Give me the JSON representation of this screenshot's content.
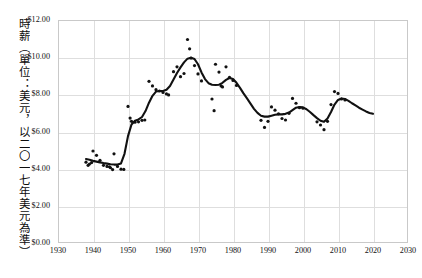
{
  "chart": {
    "type": "scatter",
    "ylabel_vertical": "時薪（單位：美元，以二〇一七年美元為準）",
    "title": "",
    "subtitle": ""
  },
  "axes": {
    "y_ticks": [
      "$0.00",
      "$2.00",
      "$4.00",
      "$6.00",
      "$8.00",
      "$10.00",
      "$12.00"
    ],
    "x_ticks": [
      "1930",
      "1940",
      "1950",
      "1960",
      "1970",
      "1980",
      "1990",
      "2000",
      "2010",
      "2020",
      "2030"
    ]
  },
  "chart_data": {
    "type": "scatter",
    "title": "",
    "xlabel": "",
    "ylabel": "時薪（單位：美元，以二〇一七年美元為準）",
    "xlim": [
      1930,
      2030
    ],
    "ylim": [
      0,
      12
    ],
    "xtick_values": [
      1930,
      1940,
      1950,
      1960,
      1970,
      1980,
      1990,
      2000,
      2010,
      2020,
      2030
    ],
    "ytick_values": [
      0,
      2,
      4,
      6,
      8,
      10,
      12
    ],
    "ytick_labels": [
      "$0.00",
      "$2.00",
      "$4.00",
      "$6.00",
      "$8.00",
      "$10.00",
      "$12.00"
    ],
    "xtick_labels": [
      "1930",
      "1940",
      "1950",
      "1960",
      "1970",
      "1980",
      "1990",
      "2000",
      "2010",
      "2020",
      "2030"
    ],
    "grid": true,
    "legend": "none",
    "series": [
      {
        "name": "scatter-points",
        "marker": "dot",
        "color": "#111111",
        "points": [
          [
            1938,
            4.35
          ],
          [
            1938.6,
            4.18
          ],
          [
            1939,
            4.25
          ],
          [
            1939.6,
            4.33
          ],
          [
            1940,
            4.95
          ],
          [
            1941,
            4.72
          ],
          [
            1942,
            4.45
          ],
          [
            1943,
            4.18
          ],
          [
            1944,
            4.12
          ],
          [
            1944.7,
            4.1
          ],
          [
            1945,
            4.05
          ],
          [
            1945.6,
            3.95
          ],
          [
            1946,
            4.8
          ],
          [
            1947,
            4.12
          ],
          [
            1948,
            3.97
          ],
          [
            1948.8,
            3.96
          ],
          [
            1950,
            7.35
          ],
          [
            1950.6,
            6.72
          ],
          [
            1951,
            6.55
          ],
          [
            1952,
            6.5
          ],
          [
            1953,
            6.52
          ],
          [
            1954,
            6.6
          ],
          [
            1954.8,
            6.62
          ],
          [
            1956,
            8.7
          ],
          [
            1957,
            8.45
          ],
          [
            1958,
            8.25
          ],
          [
            1959,
            8.18
          ],
          [
            1960,
            8.1
          ],
          [
            1961,
            8.02
          ],
          [
            1961.6,
            7.97
          ],
          [
            1963,
            9.22
          ],
          [
            1964,
            9.48
          ],
          [
            1965,
            8.95
          ],
          [
            1966,
            9.12
          ],
          [
            1967,
            10.95
          ],
          [
            1967.6,
            10.45
          ],
          [
            1968,
            9.95
          ],
          [
            1969,
            9.55
          ],
          [
            1970,
            9.1
          ],
          [
            1971,
            8.72
          ],
          [
            1974,
            7.75
          ],
          [
            1974.6,
            7.12
          ],
          [
            1975,
            9.62
          ],
          [
            1976,
            9.2
          ],
          [
            1976.6,
            8.45
          ],
          [
            1977,
            8.4
          ],
          [
            1978,
            9.48
          ],
          [
            1979,
            8.92
          ],
          [
            1980,
            8.75
          ],
          [
            1981,
            8.48
          ],
          [
            1988,
            6.6
          ],
          [
            1989,
            6.22
          ],
          [
            1990,
            6.55
          ],
          [
            1991,
            7.32
          ],
          [
            1992,
            7.15
          ],
          [
            1993,
            6.95
          ],
          [
            1994,
            6.7
          ],
          [
            1995,
            6.62
          ],
          [
            1996,
            6.98
          ],
          [
            1997,
            7.78
          ],
          [
            1998,
            7.52
          ],
          [
            1999,
            7.28
          ],
          [
            2000,
            7.25
          ],
          [
            2004,
            6.52
          ],
          [
            2005,
            6.35
          ],
          [
            2006,
            6.1
          ],
          [
            2007,
            6.55
          ],
          [
            2008,
            7.45
          ],
          [
            2009,
            8.15
          ],
          [
            2010,
            8.05
          ],
          [
            2011,
            7.75
          ],
          [
            2012,
            7.7
          ]
        ]
      },
      {
        "name": "smoothed-trend-line",
        "type": "line",
        "color": "#111111",
        "points": [
          [
            1938,
            4.52
          ],
          [
            1939,
            4.48
          ],
          [
            1940,
            4.42
          ],
          [
            1941,
            4.38
          ],
          [
            1942,
            4.34
          ],
          [
            1943,
            4.3
          ],
          [
            1944,
            4.27
          ],
          [
            1945,
            4.24
          ],
          [
            1946,
            4.22
          ],
          [
            1947,
            4.22
          ],
          [
            1948,
            4.28
          ],
          [
            1949,
            4.8
          ],
          [
            1950,
            5.75
          ],
          [
            1951,
            6.38
          ],
          [
            1952,
            6.58
          ],
          [
            1953,
            6.65
          ],
          [
            1954,
            6.78
          ],
          [
            1955,
            7.1
          ],
          [
            1956,
            7.55
          ],
          [
            1957,
            7.92
          ],
          [
            1958,
            8.15
          ],
          [
            1959,
            8.18
          ],
          [
            1960,
            8.18
          ],
          [
            1961,
            8.25
          ],
          [
            1962,
            8.45
          ],
          [
            1963,
            8.8
          ],
          [
            1964,
            9.15
          ],
          [
            1965,
            9.45
          ],
          [
            1966,
            9.72
          ],
          [
            1967,
            9.92
          ],
          [
            1968,
            9.97
          ],
          [
            1969,
            9.9
          ],
          [
            1970,
            9.62
          ],
          [
            1971,
            9.18
          ],
          [
            1972,
            8.82
          ],
          [
            1973,
            8.6
          ],
          [
            1974,
            8.52
          ],
          [
            1975,
            8.5
          ],
          [
            1976,
            8.52
          ],
          [
            1977,
            8.62
          ],
          [
            1978,
            8.78
          ],
          [
            1979,
            8.88
          ],
          [
            1980,
            8.82
          ],
          [
            1981,
            8.62
          ],
          [
            1982,
            8.35
          ],
          [
            1983,
            8.05
          ],
          [
            1984,
            7.78
          ],
          [
            1985,
            7.5
          ],
          [
            1986,
            7.22
          ],
          [
            1987,
            7.0
          ],
          [
            1988,
            6.85
          ],
          [
            1989,
            6.8
          ],
          [
            1990,
            6.8
          ],
          [
            1991,
            6.85
          ],
          [
            1992,
            6.9
          ],
          [
            1993,
            6.92
          ],
          [
            1994,
            6.92
          ],
          [
            1995,
            6.95
          ],
          [
            1996,
            7.02
          ],
          [
            1997,
            7.15
          ],
          [
            1998,
            7.28
          ],
          [
            1999,
            7.32
          ],
          [
            2000,
            7.3
          ],
          [
            2001,
            7.2
          ],
          [
            2002,
            7.05
          ],
          [
            2003,
            6.88
          ],
          [
            2004,
            6.72
          ],
          [
            2005,
            6.58
          ],
          [
            2006,
            6.52
          ],
          [
            2007,
            6.7
          ],
          [
            2008,
            7.05
          ],
          [
            2009,
            7.45
          ],
          [
            2010,
            7.7
          ],
          [
            2011,
            7.78
          ],
          [
            2012,
            7.75
          ],
          [
            2013,
            7.65
          ],
          [
            2014,
            7.52
          ],
          [
            2015,
            7.4
          ],
          [
            2016,
            7.28
          ],
          [
            2017,
            7.18
          ],
          [
            2018,
            7.08
          ],
          [
            2019,
            7.0
          ],
          [
            2020,
            6.95
          ]
        ]
      }
    ]
  }
}
